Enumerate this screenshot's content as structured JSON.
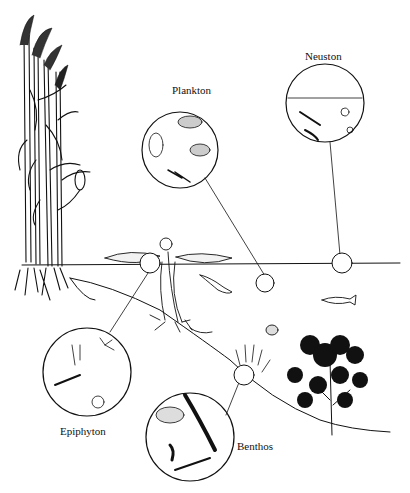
{
  "diagram": {
    "type": "ecological illustration",
    "colors": {
      "ink": "#111111",
      "background": "#ffffff"
    },
    "labels": {
      "plankton": "Plankton",
      "neuston": "Neuston",
      "epiphyton": "Epiphyton",
      "benthos": "Benthos"
    },
    "insets": [
      {
        "name": "Plankton",
        "contents": [
          "rotifer",
          "paramecium-like ciliate",
          "flagellate",
          "copepod"
        ]
      },
      {
        "name": "Neuston",
        "contents": [
          "water surface line",
          "insect larva",
          "bloodworm larva",
          "small snail/protozoa"
        ]
      },
      {
        "name": "Epiphyton",
        "contents": [
          "stalked ciliates",
          "hydra",
          "water mite",
          "rotifer"
        ]
      },
      {
        "name": "Benthos",
        "contents": [
          "diatom",
          "filamentous algae",
          "insect larva",
          "amoeba"
        ]
      }
    ],
    "scene_elements": [
      "reeds with plumes",
      "water lily pads",
      "water surface",
      "lake bottom slope",
      "newt",
      "fish",
      "water beetle",
      "shrimp",
      "submerged plant"
    ]
  }
}
